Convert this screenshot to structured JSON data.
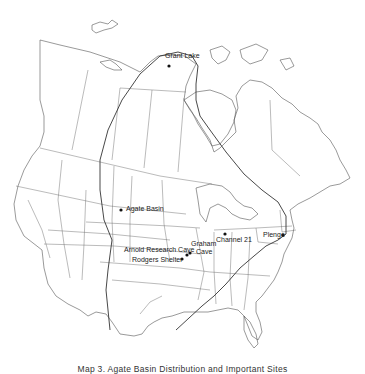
{
  "map": {
    "title_caption": "Map 3. Agate Basin Distribution and Important Sites",
    "region": "North America (United States and Canada)",
    "overlay": "Agate Basin distribution boundary",
    "sites": [
      {
        "id": "grant-lake",
        "name": "Grant Lake"
      },
      {
        "id": "agate-basin",
        "name": "Agate Basin"
      },
      {
        "id": "channel-21",
        "name": "Channel 21"
      },
      {
        "id": "plenge",
        "name": "Plenge"
      },
      {
        "id": "graham-cave",
        "name": "Graham\nCave",
        "line1": "Graham",
        "line2": "Cave"
      },
      {
        "id": "arnold-research-cave",
        "name": "Arnold Research Cave"
      },
      {
        "id": "rodgers-shelter",
        "name": "Rodgers Shelter"
      }
    ]
  }
}
